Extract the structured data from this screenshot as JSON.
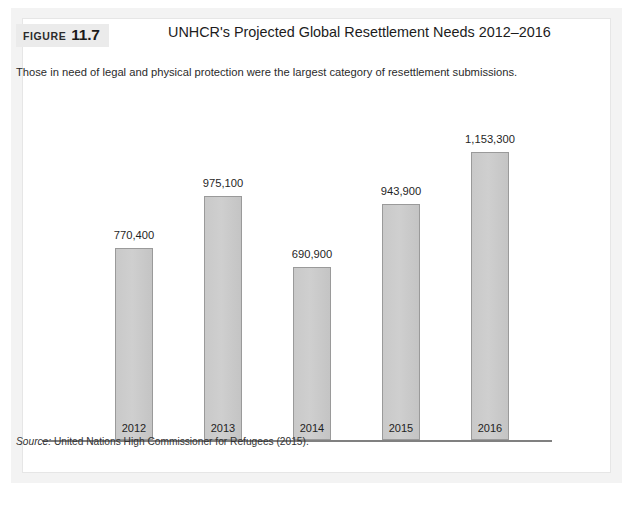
{
  "figure": {
    "tag_word": "FIGURE",
    "tag_number": "11.7",
    "title": "UNHCR's Projected Global Resettlement Needs 2012–2016",
    "subtitle": "Those in need of legal and physical protection were the largest category of resettlement submissions.",
    "source_label": "Source:",
    "source_text": "United Nations High Commissioner for Refugees (2015)."
  },
  "colors": {
    "bar_fill": "#cbcbcb",
    "bar_stroke": "#9a9a9a",
    "axis": "#808080",
    "tag_background": "#ebebeb",
    "outer_mat": "#f3f3f3",
    "footer_bar": "#4d4d4d",
    "text": "#1f1f1f"
  },
  "chart_data": {
    "type": "bar",
    "title": "UNHCR's Projected Global Resettlement Needs 2012–2016",
    "subtitle": "Those in need of legal and physical protection were the largest category of resettlement submissions.",
    "xlabel": "",
    "ylabel": "",
    "categories": [
      "2012",
      "2013",
      "2014",
      "2015",
      "2016"
    ],
    "values": [
      770400,
      975100,
      690900,
      943900,
      1153300
    ],
    "value_labels": [
      "770,400",
      "975,100",
      "690,900",
      "943,900",
      "1,153,300"
    ],
    "ylim": [
      0,
      1153300
    ],
    "grid": false,
    "legend": null,
    "axis_visible": {
      "x": true,
      "y": false
    },
    "source": "United Nations High Commissioner for Refugees (2015)."
  }
}
